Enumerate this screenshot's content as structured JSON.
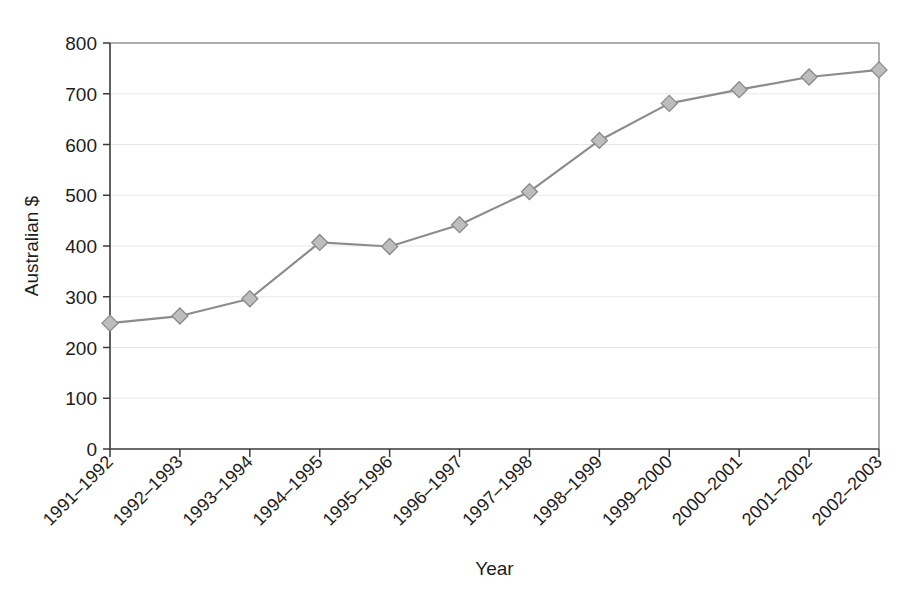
{
  "chart_data": {
    "type": "line",
    "title": "",
    "xlabel": "Year",
    "ylabel": "Australian $",
    "categories": [
      "1991–1992",
      "1992–1993",
      "1993–1994",
      "1994–1995",
      "1995–1996",
      "1996–1997",
      "1997–1998",
      "1998–1999",
      "1999–2000",
      "2000–2001",
      "2001–2002",
      "2002–2003"
    ],
    "values": [
      248,
      262,
      296,
      407,
      399,
      442,
      507,
      608,
      681,
      708,
      733,
      747
    ],
    "ylim": [
      0,
      800
    ],
    "ytick_step": 100,
    "ytick_labels": [
      "0",
      "100",
      "200",
      "300",
      "400",
      "500",
      "600",
      "700",
      "800"
    ],
    "grid": "horizontal",
    "legend": "none",
    "series": [
      {
        "name": "Australian $",
        "values": [
          248,
          262,
          296,
          407,
          399,
          442,
          507,
          608,
          681,
          708,
          733,
          747
        ],
        "line_color": "#8c8c8c",
        "marker_shape": "diamond",
        "marker_fill": "#bdbdbd",
        "marker_stroke": "#8a8a8a"
      }
    ],
    "colors": {
      "background": "#ffffff",
      "axis": "#3a3a3a",
      "grid": "#e8e8e8",
      "frame": "#6a6a6a",
      "text": "#1d1d1d"
    }
  }
}
